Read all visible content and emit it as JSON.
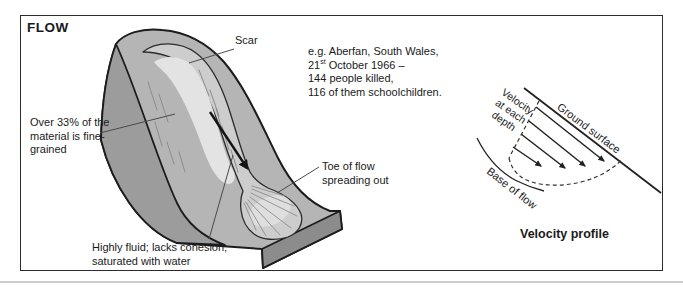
{
  "title": "FLOW",
  "hill": {
    "scar_label": "Scar",
    "over33_lines": [
      "Over 33% of the",
      "material is fine-",
      "grained"
    ],
    "toe_lines": [
      "Toe of flow",
      "spreading out"
    ],
    "fluid_lines": [
      "Highly fluid; lacks cohesion;",
      "saturated with water"
    ]
  },
  "example": {
    "line1": "e.g. Aberfan, South Wales,",
    "date_day": "21",
    "date_ordinal": "st",
    "date_rest": " October 1966 –",
    "line3": "144 people killed,",
    "line4": "116 of them schoolchildren."
  },
  "velocity_profile": {
    "velocity_label_lines": [
      "Velocity",
      "at each",
      "depth"
    ],
    "ground_surface_label": "Ground surface",
    "base_of_flow_label": "Base of flow",
    "caption": "Velocity profile"
  },
  "colors": {
    "slope": "#b5b5b5",
    "side_face": "#9c9c9c",
    "slab_face": "#8c8c8c",
    "flow_tongue": "#cdcdcd",
    "pale_highlight": "#e3e3e3",
    "outline": "#1c1c1c"
  }
}
